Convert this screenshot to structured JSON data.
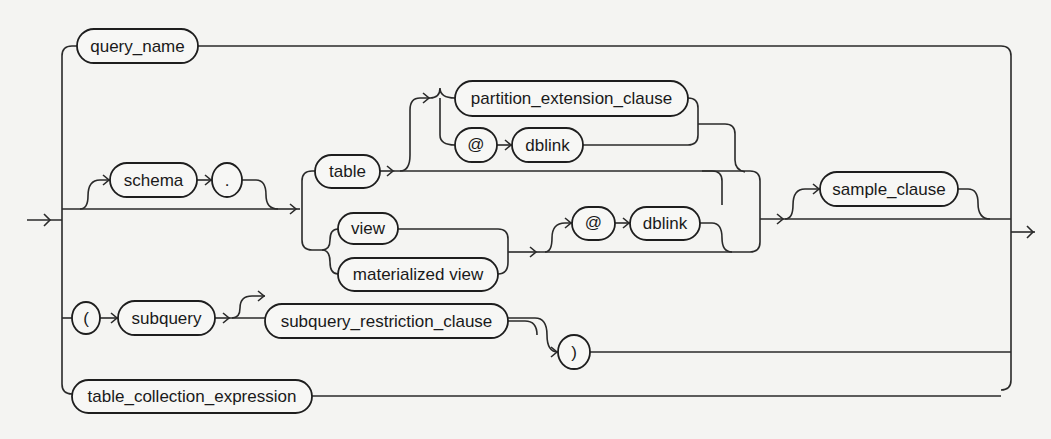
{
  "diagram": {
    "type": "railroad-syntax-diagram",
    "nodes": {
      "query_name": "query_name",
      "schema": "schema",
      "dot": ".",
      "table": "table",
      "partition_extension_clause": "partition_extension_clause",
      "at_1": "@",
      "dblink_1": "dblink",
      "view": "view",
      "materialized_view": "materialized view",
      "at_2": "@",
      "dblink_2": "dblink",
      "sample_clause": "sample_clause",
      "open_paren": "(",
      "subquery": "subquery",
      "subquery_restriction_clause": "subquery_restriction_clause",
      "close_paren": ")",
      "table_collection_expression": "table_collection_expression"
    },
    "colors": {
      "line": "#2a2a2a",
      "background": "#f4f4f2"
    }
  }
}
